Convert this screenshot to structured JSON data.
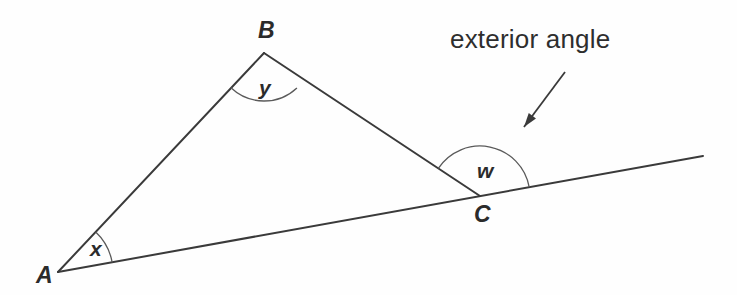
{
  "canvas": {
    "width": 737,
    "height": 295,
    "background": "#fefefe"
  },
  "style": {
    "stroke_color": "#3a3a3a",
    "arc_color": "#5a5a5a",
    "text_color": "#2b2b2b",
    "annotation_color": "#2e2e2e",
    "line_width": 2,
    "arc_width": 1.3
  },
  "diagram": {
    "type": "triangle-exterior-angle",
    "vertices": [
      {
        "id": "A",
        "label": "A",
        "x": 58,
        "y": 272,
        "label_x": 36,
        "label_y": 264
      },
      {
        "id": "B",
        "label": "B",
        "x": 264,
        "y": 53,
        "label_x": 258,
        "label_y": 19
      },
      {
        "id": "C",
        "label": "C",
        "x": 480,
        "y": 196,
        "label_x": 474,
        "label_y": 203
      }
    ],
    "segments": [
      {
        "name": "side-AB",
        "from": "A",
        "to": "B",
        "x1": 58,
        "y1": 272,
        "x2": 264,
        "y2": 53
      },
      {
        "name": "side-BC",
        "from": "B",
        "to": "C",
        "x1": 264,
        "y1": 53,
        "x2": 480,
        "y2": 196
      },
      {
        "name": "base-ray-AC-extended",
        "from": "A",
        "to": "extension",
        "x1": 58,
        "y1": 272,
        "x2": 703,
        "y2": 156
      }
    ],
    "angles": [
      {
        "id": "x",
        "label": "x",
        "at": "A",
        "kind": "interior",
        "radius": 55,
        "cx": 58,
        "cy": 272,
        "start_deg": -46.7,
        "end_deg": -10.2,
        "label_x": 90,
        "label_y": 238
      },
      {
        "id": "y",
        "label": "y",
        "at": "B",
        "kind": "interior",
        "radius": 48,
        "cx": 264,
        "cy": 53,
        "start_deg": 46.7,
        "end_deg": 133.5,
        "label_x": 259,
        "label_y": 77
      },
      {
        "id": "w",
        "label": "w",
        "at": "C",
        "kind": "exterior",
        "radius": 50,
        "cx": 480,
        "cy": 196,
        "start_deg": -10.2,
        "end_deg": -146.5,
        "label_x": 477,
        "label_y": 160
      }
    ],
    "annotation": {
      "text": "exterior angle",
      "text_x": 450,
      "text_y": 26,
      "arrow": {
        "name": "annotation-arrow",
        "x1": 565,
        "y1": 72,
        "x2": 524,
        "y2": 127,
        "head_length": 14,
        "head_width": 9
      }
    }
  }
}
